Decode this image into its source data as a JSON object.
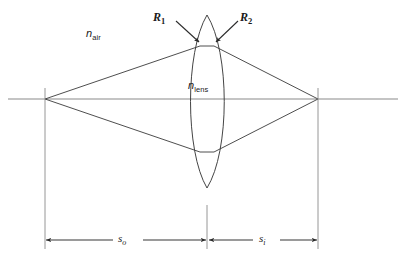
{
  "figure": {
    "kind": "thin-lens-imaging-ray-diagram",
    "width": 405,
    "height": 262,
    "background_color": "#ffffff",
    "line_color": "#3a3a3a",
    "axis_color": "#8a8a8a",
    "text_color": "#1a1a1a"
  },
  "labels": {
    "n_air": {
      "symbol": "n",
      "subscript": "air"
    },
    "n_lens": {
      "symbol": "n",
      "subscript": "lens"
    },
    "r1": {
      "symbol": "R",
      "subscript": "1"
    },
    "r2": {
      "symbol": "R",
      "subscript": "2"
    },
    "s_object": {
      "symbol": "s",
      "subscript": "o"
    },
    "s_image": {
      "symbol": "s",
      "subscript": "i"
    }
  },
  "geometry": {
    "optical_axis": {
      "y": 99,
      "x_start": 8,
      "x_end": 398
    },
    "object_point": {
      "x": 45,
      "y": 99
    },
    "image_point": {
      "x": 318,
      "y": 99
    },
    "lens": {
      "center_x": 207,
      "top_apex": {
        "x": 207,
        "y": 15
      },
      "bottom_apex": {
        "x": 207,
        "y": 188
      },
      "left_surface_bulge_x": 184,
      "right_surface_bulge_x": 230
    },
    "ray_upper_edge": {
      "x": 200,
      "y": 46
    },
    "ray_lower_edge": {
      "x": 200,
      "y": 152
    },
    "dimension_lines": {
      "left_x": 45,
      "center_x": 207,
      "right_x": 318,
      "top_y": 88,
      "bottom_y": 248,
      "arrow_y": 240
    },
    "arrow_r1": {
      "from": {
        "x": 175,
        "y": 22
      },
      "to": {
        "x": 199,
        "y": 42
      }
    },
    "arrow_r2": {
      "from": {
        "x": 239,
        "y": 22
      },
      "to": {
        "x": 216,
        "y": 42
      }
    }
  }
}
